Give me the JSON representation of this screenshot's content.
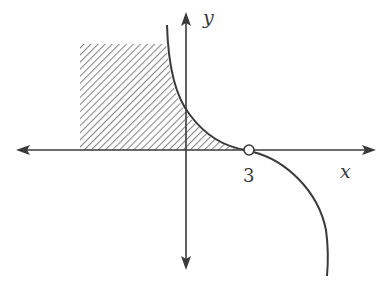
{
  "diagram": {
    "type": "function-graph",
    "colors": {
      "stroke": "#3a3a3a",
      "hatch": "#8a8a8a",
      "background": "#ffffff"
    },
    "axes": {
      "x_label": "x",
      "y_label": "y"
    },
    "ticks": [
      {
        "label": "3",
        "x_value": 3
      }
    ],
    "features": {
      "open_circle_at": "3",
      "shaded_region": "hatched region under curve, left of it, bounded by x-axis"
    }
  }
}
